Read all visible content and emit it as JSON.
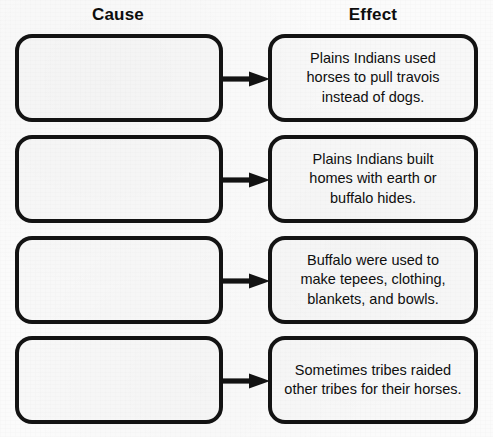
{
  "columns": {
    "cause_label": "Cause",
    "effect_label": "Effect"
  },
  "colors": {
    "stroke": "#131313",
    "box_fill": "#f8f8f8",
    "page_background": "#fbfbfb",
    "text": "#0f0f0f"
  },
  "rows": [
    {
      "cause_text": "",
      "effect_text": "Plains Indians used\nhorses to pull travois\ninstead of dogs.",
      "arrow_icon": "arrow-right-icon"
    },
    {
      "cause_text": "",
      "effect_text": "Plains Indians built\nhomes with earth or\nbuffalo hides.",
      "arrow_icon": "arrow-right-icon"
    },
    {
      "cause_text": "",
      "effect_text": "Buffalo were used to\nmake tepees, clothing,\nblankets, and bowls.",
      "arrow_icon": "arrow-right-icon"
    },
    {
      "cause_text": "",
      "effect_text": "Sometimes tribes raided\nother tribes for their horses.",
      "arrow_icon": "arrow-right-icon"
    }
  ]
}
